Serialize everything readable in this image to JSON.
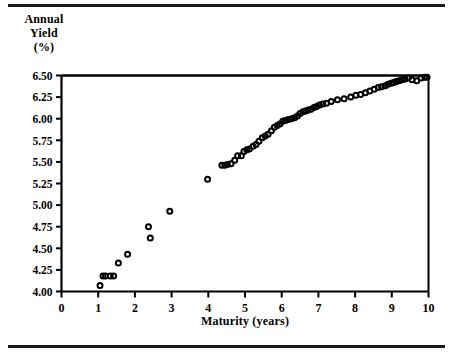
{
  "figure": {
    "ylabel_lines": [
      "Annual",
      "Yield",
      "(%)"
    ],
    "xlabel": "Maturity (years)"
  },
  "chart_data": {
    "type": "scatter",
    "title": "",
    "subtitle": "",
    "xlabel": "Maturity (years)",
    "ylabel": "Annual Yield (%)",
    "xlim": [
      0,
      10
    ],
    "ylim": [
      4.0,
      6.5
    ],
    "xticks": [
      0,
      1,
      2,
      3,
      4,
      5,
      6,
      7,
      8,
      9,
      10
    ],
    "xtick_labels": [
      "0",
      "1",
      "2",
      "3",
      "4",
      "5",
      "6",
      "7",
      "8",
      "9",
      "10"
    ],
    "yticks": [
      4.0,
      4.25,
      4.5,
      4.75,
      5.0,
      5.25,
      5.5,
      5.75,
      6.0,
      6.25,
      6.5
    ],
    "ytick_labels": [
      "4.00",
      "4.25",
      "4.50",
      "4.75",
      "5.00",
      "5.25",
      "5.50",
      "5.75",
      "6.00",
      "6.25",
      "6.50"
    ],
    "grid": false,
    "legend": null,
    "marker": "open-circle",
    "marker_color": "#000000",
    "x": [
      1.05,
      1.13,
      1.2,
      1.33,
      1.42,
      1.55,
      1.8,
      2.37,
      2.42,
      2.95,
      3.98,
      4.37,
      4.45,
      4.52,
      4.62,
      4.72,
      4.8,
      4.9,
      4.97,
      5.05,
      5.12,
      5.22,
      5.3,
      5.38,
      5.47,
      5.55,
      5.63,
      5.72,
      5.8,
      5.88,
      5.95,
      6.03,
      6.1,
      6.18,
      6.27,
      6.35,
      6.43,
      6.5,
      6.58,
      6.65,
      6.72,
      6.8,
      6.88,
      6.95,
      7.03,
      7.12,
      7.22,
      7.35,
      7.52,
      7.7,
      7.88,
      8.02,
      8.15,
      8.28,
      8.4,
      8.52,
      8.63,
      8.72,
      8.82,
      8.9,
      8.98,
      9.05,
      9.12,
      9.2,
      9.28,
      9.36,
      9.45,
      9.55,
      9.68,
      9.8,
      9.9,
      9.96
    ],
    "y": [
      4.07,
      4.18,
      4.18,
      4.18,
      4.18,
      4.33,
      4.43,
      4.75,
      4.62,
      4.93,
      5.3,
      5.46,
      5.46,
      5.47,
      5.48,
      5.52,
      5.57,
      5.57,
      5.62,
      5.64,
      5.65,
      5.68,
      5.7,
      5.74,
      5.78,
      5.8,
      5.82,
      5.86,
      5.9,
      5.92,
      5.94,
      5.97,
      5.98,
      5.99,
      6.0,
      6.01,
      6.03,
      6.06,
      6.08,
      6.09,
      6.1,
      6.11,
      6.13,
      6.14,
      6.16,
      6.17,
      6.18,
      6.2,
      6.22,
      6.23,
      6.25,
      6.27,
      6.28,
      6.3,
      6.32,
      6.34,
      6.36,
      6.37,
      6.38,
      6.4,
      6.41,
      6.42,
      6.43,
      6.44,
      6.45,
      6.46,
      6.47,
      6.45,
      6.44,
      6.47,
      6.48,
      6.48
    ]
  }
}
